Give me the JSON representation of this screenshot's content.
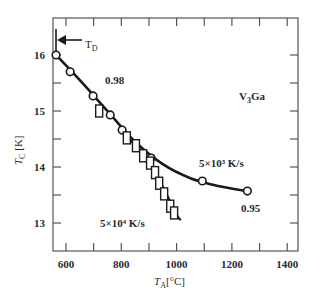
{
  "chart_data": {
    "type": "scatter",
    "title": "",
    "material_label": "V₃Ga",
    "xlabel": "T_A [°C]",
    "ylabel": "T_C [K]",
    "xlim": [
      560,
      1480
    ],
    "ylim": [
      12.55,
      16.65
    ],
    "x_ticks": [
      600,
      800,
      1000,
      1200,
      1400
    ],
    "x_minor_ticks": [
      600,
      700,
      800,
      900,
      1000,
      1100,
      1200,
      1300,
      1400
    ],
    "y_ticks": [
      13,
      14,
      15,
      16
    ],
    "y_minor_ticks": [
      13,
      13.5,
      14,
      14.5,
      15,
      15.5,
      16
    ],
    "grid": false,
    "legend": null,
    "series": [
      {
        "name": "5×10³ K/s",
        "marker": "circle",
        "end_label": "0.95",
        "start_label": "0.98",
        "points": [
          {
            "x": 564,
            "y": 16.0
          },
          {
            "x": 615,
            "y": 15.7
          },
          {
            "x": 698,
            "y": 15.27
          },
          {
            "x": 760,
            "y": 14.93
          },
          {
            "x": 803,
            "y": 14.66
          },
          {
            "x": 908,
            "y": 14.16
          },
          {
            "x": 1093,
            "y": 13.75
          },
          {
            "x": 1256,
            "y": 13.57
          }
        ],
        "curve": [
          {
            "x": 564,
            "y": 16.0
          },
          {
            "x": 650,
            "y": 15.55
          },
          {
            "x": 750,
            "y": 15.0
          },
          {
            "x": 850,
            "y": 14.45
          },
          {
            "x": 950,
            "y": 14.05
          },
          {
            "x": 1050,
            "y": 13.8
          },
          {
            "x": 1150,
            "y": 13.66
          },
          {
            "x": 1256,
            "y": 13.57
          }
        ]
      },
      {
        "name": "5×10⁴ K/s",
        "marker": "square",
        "points": [
          {
            "x": 720,
            "y": 15.0
          },
          {
            "x": 820,
            "y": 14.52
          },
          {
            "x": 853,
            "y": 14.38
          },
          {
            "x": 879,
            "y": 14.2
          },
          {
            "x": 904,
            "y": 14.07
          },
          {
            "x": 922,
            "y": 13.9
          },
          {
            "x": 937,
            "y": 13.71
          },
          {
            "x": 955,
            "y": 13.52
          },
          {
            "x": 977,
            "y": 13.3
          },
          {
            "x": 991,
            "y": 13.18
          }
        ],
        "curve": [
          {
            "x": 800,
            "y": 14.65
          },
          {
            "x": 900,
            "y": 14.1
          },
          {
            "x": 950,
            "y": 13.65
          },
          {
            "x": 1000,
            "y": 13.15
          },
          {
            "x": 1015,
            "y": 13.05
          }
        ]
      }
    ],
    "annotations": [
      {
        "id": "td",
        "text": "T_D",
        "x": 564,
        "arrow": "left"
      },
      {
        "id": "rate_high",
        "text": "5×10⁴ K/s"
      },
      {
        "id": "rate_low",
        "text": "5×10³ K/s"
      },
      {
        "id": "frac_098",
        "text": "0.98"
      },
      {
        "id": "frac_095",
        "text": "0.95"
      }
    ]
  },
  "labels": {
    "td_main": "T",
    "td_sub": "D",
    "material_main": "V",
    "material_sub": "3",
    "material_rest": "Ga",
    "ylabel_main": "T",
    "ylabel_sub": "C",
    "ylabel_unit": " [K]",
    "xlabel_main": "T",
    "xlabel_sub": "A",
    "xlabel_unit": "[°C]",
    "rate_high": "5×10⁴ K/s",
    "rate_low": "5×10³ K/s",
    "frac_098": "0.98",
    "frac_095": "0.95"
  },
  "colors": {
    "ink": "#1a1a1a",
    "axis": "#555555",
    "background": "#ffffff"
  }
}
